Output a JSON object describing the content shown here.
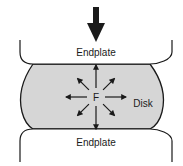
{
  "diagram": {
    "labels": {
      "top_endplate": "Endplate",
      "bottom_endplate": "Endplate",
      "disk": "Disk",
      "force": "F"
    },
    "colors": {
      "stroke": "#1a1a1a",
      "disk_fill": "#d6d6d6",
      "endplate_fill": "#ffffff",
      "background": "#ffffff"
    },
    "load_arrow": {
      "direction": "down"
    },
    "force_arrows": {
      "count": 8,
      "directions": [
        "up",
        "up-right",
        "right",
        "down-right",
        "down",
        "down-left",
        "left",
        "up-left"
      ]
    }
  }
}
